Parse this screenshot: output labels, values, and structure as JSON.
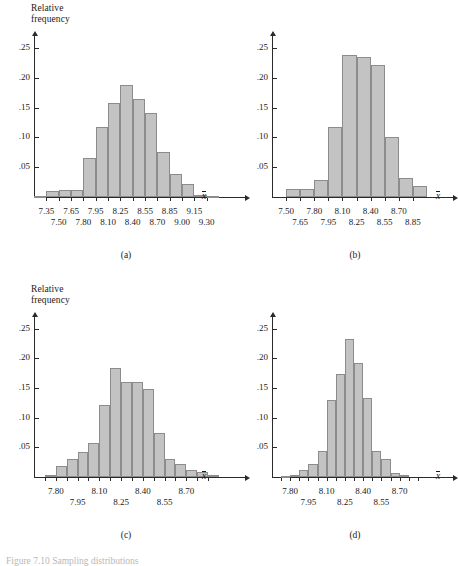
{
  "figure": {
    "ylabel": "Relative\nfrequency",
    "xaxis_symbol": "x",
    "truncated_caption": "Figure 7.10  Sampling distributions"
  },
  "chart_data": [
    {
      "type": "bar",
      "title": "(a)",
      "panel": "a",
      "xlabel": "x̄",
      "ylabel": "Relative frequency",
      "yticks": [
        0.05,
        0.1,
        0.15,
        0.2,
        0.25
      ],
      "ytick_labels": [
        ".05",
        ".10",
        ".15",
        ".20",
        ".25"
      ],
      "ylim": [
        0,
        0.27
      ],
      "xlim": [
        7.2,
        9.45
      ],
      "bin_width": 0.15,
      "xtick_labels_top": [
        "7.35",
        "7.65",
        "7.95",
        "8.25",
        "8.55",
        "8.85",
        "9.15"
      ],
      "xtick_labels_bottom": [
        "7.50",
        "7.80",
        "8.10",
        "8.40",
        "8.70",
        "9.00",
        "9.30"
      ],
      "bin_starts": [
        7.2,
        7.35,
        7.5,
        7.65,
        7.8,
        7.95,
        8.1,
        8.25,
        8.4,
        8.55,
        8.7,
        8.85,
        9.0,
        9.15,
        9.3
      ],
      "values": [
        0.002,
        0.01,
        0.012,
        0.012,
        0.065,
        0.118,
        0.158,
        0.188,
        0.165,
        0.141,
        0.075,
        0.038,
        0.021,
        0.004,
        0.002
      ],
      "grid": false,
      "legend": "none"
    },
    {
      "type": "bar",
      "title": "(b)",
      "panel": "b",
      "xlabel": "x̄",
      "ylabel": "Relative frequency",
      "yticks": [
        0.05,
        0.1,
        0.15,
        0.2,
        0.25
      ],
      "ytick_labels": [
        ".05",
        ".10",
        ".15",
        ".20",
        ".25"
      ],
      "ylim": [
        0,
        0.27
      ],
      "xlim": [
        7.35,
        9.0
      ],
      "bin_width": 0.15,
      "xtick_labels_top": [
        "7.50",
        "7.80",
        "8.10",
        "8.40",
        "8.70"
      ],
      "xtick_labels_bottom": [
        "7.65",
        "7.95",
        "8.25",
        "8.55",
        "8.85"
      ],
      "bin_starts": [
        7.35,
        7.5,
        7.65,
        7.8,
        7.95,
        8.1,
        8.25,
        8.4,
        8.55,
        8.7,
        8.85
      ],
      "values": [
        0.0,
        0.013,
        0.014,
        0.029,
        0.118,
        0.238,
        0.234,
        0.222,
        0.1,
        0.032,
        0.019
      ],
      "grid": false,
      "legend": "none"
    },
    {
      "type": "bar",
      "title": "(c)",
      "panel": "c",
      "xlabel": "x̄",
      "ylabel": "Relative frequency",
      "yticks": [
        0.05,
        0.1,
        0.15,
        0.2,
        0.25
      ],
      "ytick_labels": [
        ".05",
        ".10",
        ".15",
        ".20",
        ".25"
      ],
      "ylim": [
        0,
        0.27
      ],
      "xlim": [
        7.65,
        8.925
      ],
      "bin_width": 0.075,
      "xtick_labels_top": [
        "7.80",
        "8.10",
        "8.40",
        "8.70"
      ],
      "xtick_labels_bottom": [
        "7.95",
        "8.25",
        "8.55"
      ],
      "bin_starts": [
        7.65,
        7.725,
        7.8,
        7.875,
        7.95,
        8.025,
        8.1,
        8.175,
        8.25,
        8.325,
        8.4,
        8.475,
        8.55,
        8.625,
        8.7,
        8.775,
        8.85
      ],
      "values": [
        0.0,
        0.004,
        0.018,
        0.03,
        0.043,
        0.058,
        0.121,
        0.184,
        0.16,
        0.16,
        0.149,
        0.075,
        0.03,
        0.022,
        0.012,
        0.008,
        0.003
      ],
      "grid": false,
      "legend": "none"
    },
    {
      "type": "bar",
      "title": "(d)",
      "panel": "d",
      "xlabel": "x̄",
      "ylabel": "Relative frequency",
      "yticks": [
        0.05,
        0.1,
        0.15,
        0.2,
        0.25
      ],
      "ytick_labels": [
        ".05",
        ".10",
        ".15",
        ".20",
        ".25"
      ],
      "ylim": [
        0,
        0.27
      ],
      "xlim": [
        7.65,
        8.925
      ],
      "bin_width": 0.075,
      "xtick_labels_top": [
        "7.80",
        "8.10",
        "8.40",
        "8.70"
      ],
      "xtick_labels_bottom": [
        "7.95",
        "8.25",
        "8.55"
      ],
      "bin_starts": [
        7.65,
        7.725,
        7.8,
        7.875,
        7.95,
        8.025,
        8.1,
        8.175,
        8.25,
        8.325,
        8.4,
        8.475,
        8.55,
        8.625,
        8.7,
        8.775,
        8.85
      ],
      "values": [
        0.0,
        0.002,
        0.004,
        0.011,
        0.022,
        0.044,
        0.13,
        0.173,
        0.233,
        0.192,
        0.133,
        0.044,
        0.031,
        0.006,
        0.003,
        0.0,
        0.0
      ],
      "grid": false,
      "legend": "none"
    }
  ]
}
